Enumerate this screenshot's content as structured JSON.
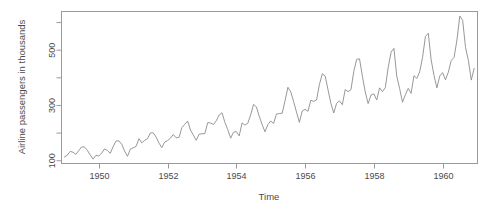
{
  "chart_data": {
    "type": "line",
    "title": "",
    "subtitle": "",
    "xlabel": "Time",
    "ylabel": "Airline passengers in thousands",
    "grid": false,
    "legend": false,
    "legend_position": "none",
    "line_color": "#8c8c8c",
    "box_color": "#9a9a9a",
    "text_color": "#4a4a4a",
    "xlim": [
      1948.9,
      1961.0
    ],
    "ylim": [
      90,
      640
    ],
    "xticks": [
      1950,
      1952,
      1954,
      1956,
      1958,
      1960
    ],
    "xtick_labels": [
      "1950",
      "1952",
      "1954",
      "1956",
      "1958",
      "1960"
    ],
    "yticks": [
      100,
      200,
      300,
      400,
      500,
      600
    ],
    "ytick_labels": [
      "100",
      "",
      "300",
      "",
      "500",
      ""
    ],
    "ytick_labeled": [
      100,
      300,
      500
    ],
    "x_start": 1949.0,
    "x_step": 0.0833333,
    "series": [
      {
        "name": "AirPassengers",
        "values": [
          112,
          118,
          132,
          129,
          121,
          135,
          148,
          148,
          136,
          119,
          104,
          118,
          115,
          126,
          141,
          135,
          125,
          149,
          170,
          170,
          158,
          133,
          114,
          140,
          145,
          150,
          178,
          163,
          172,
          178,
          199,
          199,
          184,
          162,
          146,
          166,
          171,
          180,
          193,
          181,
          183,
          218,
          230,
          242,
          209,
          191,
          172,
          194,
          196,
          196,
          236,
          235,
          229,
          243,
          264,
          272,
          237,
          211,
          180,
          201,
          204,
          188,
          235,
          227,
          234,
          264,
          302,
          293,
          259,
          229,
          203,
          229,
          242,
          233,
          267,
          269,
          270,
          315,
          364,
          347,
          312,
          274,
          237,
          278,
          284,
          277,
          317,
          313,
          318,
          374,
          413,
          405,
          355,
          306,
          271,
          306,
          315,
          301,
          356,
          348,
          355,
          422,
          465,
          467,
          404,
          347,
          305,
          336,
          340,
          318,
          362,
          348,
          363,
          435,
          491,
          505,
          404,
          359,
          310,
          337,
          360,
          342,
          406,
          396,
          420,
          472,
          548,
          559,
          463,
          407,
          362,
          405,
          417,
          391,
          419,
          461,
          472,
          535,
          622,
          606,
          508,
          461,
          390,
          432
        ]
      }
    ]
  }
}
